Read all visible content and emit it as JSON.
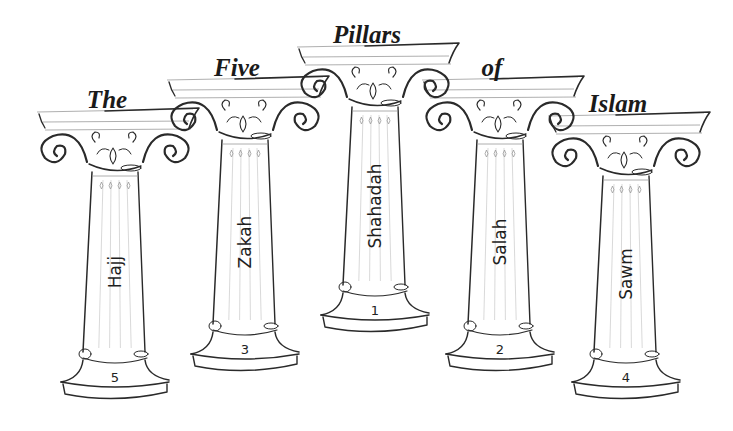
{
  "title": {
    "words": [
      "The",
      "Five",
      "Pillars",
      "of",
      "Islam"
    ],
    "full_text": "The Five Pillars of Islam"
  },
  "pillars": [
    {
      "position": "far-left",
      "title_word": "The",
      "label": "Hajj",
      "rank": "5",
      "cx": 115,
      "top": 112,
      "bottom": 400
    },
    {
      "position": "left",
      "title_word": "Five",
      "label": "Zakah",
      "rank": "3",
      "cx": 245,
      "top": 80,
      "bottom": 372
    },
    {
      "position": "center",
      "title_word": "Pillars",
      "label": "Shahadah",
      "rank": "1",
      "cx": 375,
      "top": 47,
      "bottom": 333
    },
    {
      "position": "right",
      "title_word": "of",
      "label": "Salah",
      "rank": "2",
      "cx": 500,
      "top": 80,
      "bottom": 372
    },
    {
      "position": "far-right",
      "title_word": "Islam",
      "label": "Sawm",
      "rank": "4",
      "cx": 626,
      "top": 116,
      "bottom": 400
    }
  ],
  "colors": {
    "ink": "#2a2a2a",
    "background": "#ffffff",
    "shading": "#c8c8c8"
  }
}
